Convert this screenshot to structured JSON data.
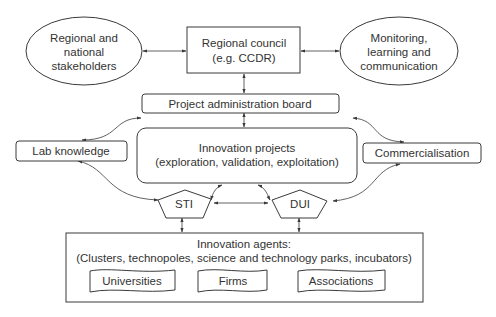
{
  "diagram": {
    "colors": {
      "stroke": "#3a3a3a",
      "text": "#333333",
      "background": "#ffffff"
    },
    "nodes": {
      "regional_stakeholders": {
        "shape": "ellipse",
        "lines": [
          "Regional and",
          "national",
          "stakeholders"
        ]
      },
      "regional_council": {
        "shape": "rectangle",
        "lines": [
          "Regional council",
          "(e.g. CCDR)"
        ]
      },
      "monitoring": {
        "shape": "ellipse",
        "lines": [
          "Monitoring,",
          "learning and",
          "communication"
        ]
      },
      "project_admin_board": {
        "shape": "rounded-rectangle",
        "label": "Project administration board"
      },
      "lab_knowledge": {
        "shape": "rounded-rectangle",
        "label": "Lab knowledge"
      },
      "innovation_projects": {
        "shape": "rounded-rectangle",
        "lines": [
          "Innovation projects",
          "(exploration, validation, exploitation)"
        ]
      },
      "commercialisation": {
        "shape": "rounded-rectangle",
        "label": "Commercialisation"
      },
      "sti": {
        "shape": "pentagon",
        "label": "STI"
      },
      "dui": {
        "shape": "pentagon",
        "label": "DUI"
      },
      "innovation_agents": {
        "shape": "rectangle",
        "lines": [
          "Innovation agents:",
          "(Clusters, technopoles, science and technology parks, incubators)"
        ],
        "members": [
          {
            "label": "Universities",
            "shape": "document"
          },
          {
            "label": "Firms",
            "shape": "document"
          },
          {
            "label": "Associations",
            "shape": "document"
          }
        ]
      }
    },
    "edges": [
      {
        "from": "regional_stakeholders",
        "to": "regional_council",
        "type": "bidirectional"
      },
      {
        "from": "regional_council",
        "to": "monitoring",
        "type": "bidirectional"
      },
      {
        "from": "regional_council",
        "to": "project_admin_board",
        "type": "bidirectional"
      },
      {
        "from": "project_admin_board",
        "to": "innovation_projects",
        "type": "bidirectional"
      },
      {
        "from": "innovation_projects",
        "to": "lab_knowledge",
        "type": "bidirectional"
      },
      {
        "from": "lab_knowledge",
        "to": "sti",
        "type": "bidirectional"
      },
      {
        "from": "innovation_projects",
        "to": "commercialisation",
        "type": "bidirectional"
      },
      {
        "from": "commercialisation",
        "to": "dui",
        "type": "bidirectional"
      },
      {
        "from": "innovation_projects",
        "to": "sti",
        "type": "bidirectional"
      },
      {
        "from": "innovation_projects",
        "to": "dui",
        "type": "bidirectional"
      },
      {
        "from": "sti",
        "to": "dui",
        "type": "bidirectional"
      },
      {
        "from": "sti",
        "to": "innovation_agents",
        "type": "bidirectional"
      },
      {
        "from": "dui",
        "to": "innovation_agents",
        "type": "bidirectional"
      }
    ]
  }
}
